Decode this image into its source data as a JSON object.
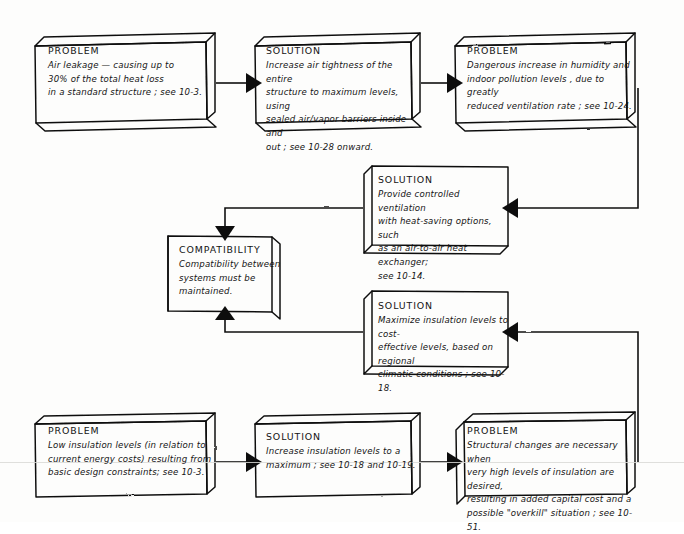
{
  "diagram": {
    "ink_color": "#101010",
    "paper_color": "#fdfdfc",
    "artifact_line_color": "#d9d9d6"
  },
  "nodes": [
    {
      "id": "problem-air-leakage",
      "kind": "PROBLEM",
      "heading": "PROBLEM",
      "body": "Air leakage — causing up to 30% of the total heat loss in a standard structure ; see 10-3.",
      "lines": [
        "Air leakage — causing up to",
        "30% of the total heat loss",
        "in a standard structure ; see 10-3."
      ],
      "x": 35,
      "y": 38,
      "w": 180,
      "h": 90
    },
    {
      "id": "solution-air-tightness",
      "kind": "SOLUTION",
      "heading": "SOLUTION",
      "body": "Increase air tightness of the entire structure to maximum levels, using sealed air/vapor barriers inside and out ; see 10-28 onward.",
      "lines": [
        "Increase air tightness of the entire",
        "structure to maximum levels, using",
        "sealed air/vapor barriers inside and",
        "out ; see 10-28 onward."
      ],
      "x": 255,
      "y": 38,
      "w": 165,
      "h": 90
    },
    {
      "id": "problem-humidity-pollution",
      "kind": "PROBLEM",
      "heading": "PROBLEM",
      "body": "Dangerous increase in humidity and indoor pollution levels, due to greatly reduced ventilation rate; see 10-24.",
      "lines": [
        "Dangerous increase in humidity and",
        "indoor pollution levels , due to greatly",
        "reduced ventilation rate ; see 10-24."
      ],
      "x": 455,
      "y": 38,
      "w": 180,
      "h": 90
    },
    {
      "id": "solution-controlled-ventilation",
      "kind": "SOLUTION",
      "heading": "SOLUTION",
      "body": "Provide controlled ventilation with heat-saving options, such as an air-to-air heat exchanger; see 10-14.",
      "lines": [
        "Provide  controlled ventilation",
        "with heat-saving options, such",
        "as an air-to-air heat exchanger;",
        "see 10-14."
      ],
      "x": 363,
      "y": 166,
      "w": 145,
      "h": 88
    },
    {
      "id": "compatibility",
      "kind": "COMPATIBILITY",
      "heading": "COMPATIBILITY",
      "body": "Compatibility between systems must be maintained.",
      "lines": [
        "Compatibility between",
        "systems must be",
        "maintained."
      ],
      "x": 168,
      "y": 236,
      "w": 112,
      "h": 76
    },
    {
      "id": "solution-maximize-insulation",
      "kind": "SOLUTION",
      "heading": "SOLUTION",
      "body": "Maximize insulation levels to cost-effective levels, based on regional climatic conditions ; see 10-18.",
      "lines": [
        "Maximize insulation levels to cost-",
        "effective levels, based on regional",
        "climatic conditions ; see 10-18."
      ],
      "x": 363,
      "y": 291,
      "w": 145,
      "h": 84
    },
    {
      "id": "problem-low-insulation",
      "kind": "PROBLEM",
      "heading": "PROBLEM",
      "body": "Low insulation levels (in relation to current energy costs) resulting from basic design constraints; see 10-3.",
      "lines": [
        "Low insulation levels (in relation to",
        "current energy costs) resulting from",
        "basic design constraints;  see 10-3."
      ],
      "x": 35,
      "y": 415,
      "w": 180,
      "h": 87
    },
    {
      "id": "solution-increase-insulation",
      "kind": "SOLUTION",
      "heading": "SOLUTION",
      "body": "Increase insulation levels to a maximum ; see 10-18 and 10-19.",
      "lines": [
        "Increase insulation levels to a",
        "maximum ; see 10-18 and 10-19."
      ],
      "x": 255,
      "y": 415,
      "w": 165,
      "h": 87
    },
    {
      "id": "problem-structural-changes",
      "kind": "PROBLEM",
      "heading": "PROBLEM",
      "body": "Structural changes are necessary when very high levels of insulation are desired, resulting in added capital cost and a possible \"overkill\" situation ; see 10-51.",
      "lines": [
        "Structural changes are necessary when",
        "very high levels of insulation are desired,",
        "resulting in added capital cost and a",
        "possible \"overkill\" situation ; see 10-51."
      ],
      "x": 455,
      "y": 415,
      "w": 180,
      "h": 87
    }
  ],
  "connectors": [
    {
      "id": "c1",
      "from": "problem-air-leakage",
      "to": "solution-air-tightness",
      "label": ""
    },
    {
      "id": "c2",
      "from": "solution-air-tightness",
      "to": "problem-humidity-pollution",
      "label": ""
    },
    {
      "id": "c3",
      "from": "problem-humidity-pollution",
      "to": "solution-controlled-ventilation",
      "label": ""
    },
    {
      "id": "c4",
      "from": "solution-controlled-ventilation",
      "to": "compatibility",
      "label": ""
    },
    {
      "id": "c5",
      "from": "solution-maximize-insulation",
      "to": "compatibility",
      "label": ""
    },
    {
      "id": "c6",
      "from": "problem-structural-changes",
      "to": "solution-maximize-insulation",
      "label": ""
    },
    {
      "id": "c7",
      "from": "problem-low-insulation",
      "to": "solution-increase-insulation",
      "label": ""
    },
    {
      "id": "c8",
      "from": "solution-increase-insulation",
      "to": "problem-structural-changes",
      "label": ""
    }
  ]
}
